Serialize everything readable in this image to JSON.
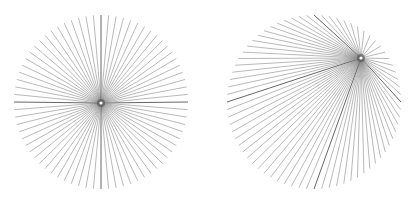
{
  "figure": {
    "width": 414,
    "height": 204,
    "background": "#ffffff",
    "line_color": "#8a8a8a",
    "panels": [
      {
        "name": "centered-star",
        "circle_center": [
          101,
          102
        ],
        "radius": 87,
        "focus_point": [
          101,
          103
        ],
        "spoke_count": 72
      },
      {
        "name": "offset-star",
        "circle_center": [
          314,
          102
        ],
        "radius": 87,
        "focus_point": [
          361,
          58
        ],
        "spoke_count": 72
      }
    ]
  }
}
